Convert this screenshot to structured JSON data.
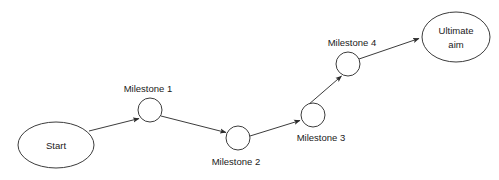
{
  "diagram": {
    "type": "flowchart",
    "background_color": "#ffffff",
    "stroke_color": "#3c3c3c",
    "text_color": "#1a1a1a",
    "nodes": [
      {
        "id": "start",
        "label": "Start",
        "shape": "ellipse",
        "label_position": "inside",
        "cx": 56,
        "cy": 145,
        "rx": 38,
        "ry": 23
      },
      {
        "id": "milestone1",
        "label": "Milestone 1",
        "shape": "circle",
        "label_position": "above",
        "cx": 150,
        "cy": 110,
        "rx": 12,
        "ry": 12,
        "label_x": 148,
        "label_y": 92
      },
      {
        "id": "milestone2",
        "label": "Milestone 2",
        "shape": "circle",
        "label_position": "below",
        "cx": 238,
        "cy": 138,
        "rx": 12,
        "ry": 12,
        "label_x": 236,
        "label_y": 164
      },
      {
        "id": "milestone3",
        "label": "Milestone 3",
        "shape": "circle",
        "label_position": "below",
        "cx": 313,
        "cy": 115,
        "rx": 12,
        "ry": 12,
        "label_x": 321,
        "label_y": 140
      },
      {
        "id": "milestone4",
        "label": "Milestone 4",
        "shape": "circle",
        "label_position": "above",
        "cx": 348,
        "cy": 64,
        "rx": 12,
        "ry": 12,
        "label_x": 352,
        "label_y": 45
      },
      {
        "id": "ultimate_aim",
        "label_line1": "Ultimate",
        "label_line2": "aim",
        "shape": "ellipse",
        "label_position": "inside",
        "cx": 456,
        "cy": 37,
        "rx": 34,
        "ry": 25
      }
    ],
    "edges": [
      {
        "id": "edge-start-milestone1",
        "from": "start",
        "to": "milestone1",
        "x1": 89,
        "y1": 131,
        "x2": 141,
        "y2": 118,
        "arrow": "end"
      },
      {
        "id": "edge-milestone1-milestone2",
        "from": "milestone1",
        "to": "milestone2",
        "x1": 161,
        "y1": 116,
        "x2": 228,
        "y2": 133,
        "arrow": "end"
      },
      {
        "id": "edge-milestone2-milestone3",
        "from": "milestone2",
        "to": "milestone3",
        "x1": 250,
        "y1": 136,
        "x2": 302,
        "y2": 120,
        "arrow": "end"
      },
      {
        "id": "edge-milestone3-milestone4",
        "from": "milestone3",
        "to": "milestone4",
        "x1": 309,
        "y1": 104,
        "x2": 342,
        "y2": 75,
        "arrow": "end"
      },
      {
        "id": "edge-milestone4-ultimate",
        "from": "milestone4",
        "to": "ultimate_aim",
        "x1": 359,
        "y1": 59,
        "x2": 421,
        "y2": 38,
        "arrow": "end"
      }
    ]
  }
}
